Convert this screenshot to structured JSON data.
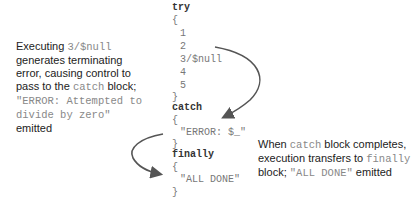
{
  "code": {
    "try_kw": "try",
    "try_open": "{",
    "try_lines": [
      "1",
      "2",
      "3/$null",
      "4",
      "5"
    ],
    "try_close": "}",
    "catch_kw": "catch",
    "catch_open": "{",
    "catch_line": "\"ERROR: $_\"",
    "catch_close": "}",
    "finally_kw": "finally",
    "finally_open": "{",
    "finally_line": "\"ALL DONE\"",
    "finally_close": "}"
  },
  "left_note": {
    "t1": "Executing ",
    "m1": "3/$null",
    "t2": "generates terminating error, causing control to pass to the ",
    "m2": "catch",
    "t3": " block; ",
    "m3": "\"ERROR: Attempted to divide by zero\"",
    "t4": " emitted"
  },
  "right_note": {
    "t1": "When ",
    "m1": "catch",
    "t2": " block completes, execution transfers to ",
    "m2": "finally",
    "t3": " block; ",
    "m3": "\"ALL DONE\"",
    "t4": " emitted"
  },
  "colors": {
    "arrow": "#555555",
    "code_keyword": "#333333",
    "code_text": "#777777"
  }
}
